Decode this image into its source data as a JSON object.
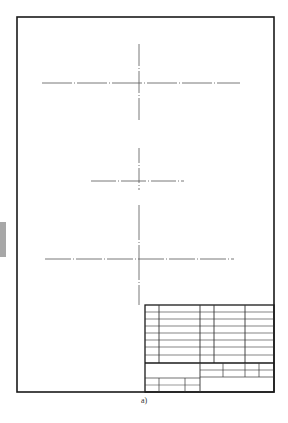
{
  "caption": "a)",
  "colors": {
    "frame": "#1a1a1a",
    "centerline": "#555555",
    "grid": "#333333",
    "side_tab": "#a7a7a7"
  },
  "frame": {
    "x": 17,
    "y": 17,
    "width": 257,
    "height": 375
  },
  "centerlines": [
    {
      "name": "view-1",
      "h": {
        "y": 83,
        "x1": 42,
        "x2": 240
      },
      "v": {
        "x": 139,
        "y1": 44,
        "y2": 122
      }
    },
    {
      "name": "view-2",
      "h": {
        "y": 181,
        "x1": 91,
        "x2": 184
      },
      "v": {
        "x": 139,
        "y1": 148,
        "y2": 190
      }
    },
    {
      "name": "view-3",
      "h": {
        "y": 259,
        "x1": 45,
        "x2": 234
      },
      "v": {
        "x": 139,
        "y1": 205,
        "y2": 305
      }
    }
  ],
  "title_block": {
    "x": 145,
    "y": 305,
    "width": 129,
    "height": 87
  }
}
